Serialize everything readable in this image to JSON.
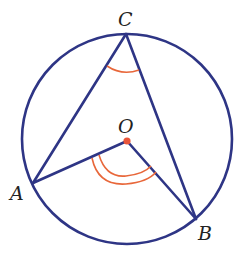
{
  "diagram": {
    "colors": {
      "circle": "#2e3585",
      "arc": "#e8673a",
      "center": "#e8553a",
      "label": "#222222"
    },
    "circle": {
      "cx": 127,
      "cy": 139,
      "r": 105
    },
    "points": {
      "A": {
        "label": "A",
        "x": 33,
        "y": 183
      },
      "B": {
        "label": "B",
        "x": 196,
        "y": 219
      },
      "C": {
        "label": "C",
        "x": 126,
        "y": 34
      },
      "O": {
        "label": "O",
        "x": 127,
        "y": 141
      }
    },
    "segments": [
      "CA",
      "CB",
      "OA",
      "OB"
    ],
    "angle_marks": [
      {
        "vertex": "C",
        "arcs": 1
      },
      {
        "vertex": "O",
        "arcs": 2
      }
    ]
  }
}
